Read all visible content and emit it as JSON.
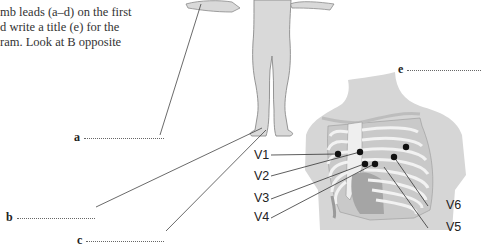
{
  "instructions": {
    "lines": [
      "mb leads (a–d) on the first",
      "d write a title (e) for the",
      "ram. Look at B opposite"
    ]
  },
  "answer_labels": [
    {
      "letter": "a",
      "blank": ""
    },
    {
      "letter": "b",
      "blank": ""
    },
    {
      "letter": "c",
      "blank": ""
    },
    {
      "letter": "e",
      "blank": ""
    }
  ],
  "chest_leads": [
    "V1",
    "V2",
    "V3",
    "V4",
    "V5",
    "V6"
  ],
  "colors": {
    "skin": "#d9d9d9",
    "outline": "#8a8a8a",
    "bone": "#ececec",
    "dark_bone": "#a8a8a8",
    "leader": "#444444",
    "electrode": "#111111"
  }
}
